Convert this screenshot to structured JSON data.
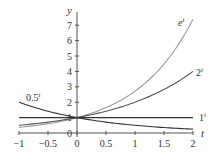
{
  "chart_data": {
    "type": "line",
    "title": "",
    "xlabel": "t",
    "ylabel": "y",
    "xlim": [
      -1,
      2
    ],
    "ylim": [
      0,
      7.6
    ],
    "x_ticks": [
      -1,
      -0.5,
      0,
      0.5,
      1,
      1.5,
      2
    ],
    "x_tick_labels": [
      "−1",
      "−0.5",
      "0",
      "0.5",
      "1",
      "1.5",
      "2"
    ],
    "y_ticks": [
      0,
      1,
      2,
      3,
      4,
      5,
      6,
      7
    ],
    "y_tick_labels": [
      "0",
      "1",
      "2",
      "3",
      "4",
      "5",
      "6",
      "7"
    ],
    "grid": false,
    "legend": "inline curve labels",
    "series": [
      {
        "name": "e^t",
        "label_base": "e",
        "label_exp": "t",
        "base": 2.718281828,
        "color": "#9a9a9a",
        "x": [
          -1,
          -0.5,
          0,
          0.5,
          1,
          1.5,
          2
        ],
        "values": [
          0.37,
          0.61,
          1.0,
          1.65,
          2.72,
          4.48,
          7.39
        ]
      },
      {
        "name": "2^t",
        "label_base": "2",
        "label_exp": "t",
        "base": 2,
        "color": "#555555",
        "x": [
          -1,
          -0.5,
          0,
          0.5,
          1,
          1.5,
          2
        ],
        "values": [
          0.5,
          0.71,
          1.0,
          1.41,
          2.0,
          2.83,
          4.0
        ]
      },
      {
        "name": "1^t",
        "label_base": "1",
        "label_exp": "t",
        "base": 1,
        "color": "#333333",
        "x": [
          -1,
          -0.5,
          0,
          0.5,
          1,
          1.5,
          2
        ],
        "values": [
          1,
          1,
          1,
          1,
          1,
          1,
          1
        ]
      },
      {
        "name": "0.5^t",
        "label_base": "0.5",
        "label_exp": "t",
        "base": 0.5,
        "color": "#333333",
        "x": [
          -1,
          -0.5,
          0,
          0.5,
          1,
          1.5,
          2
        ],
        "values": [
          2.0,
          1.41,
          1.0,
          0.71,
          0.5,
          0.35,
          0.25
        ]
      }
    ]
  }
}
